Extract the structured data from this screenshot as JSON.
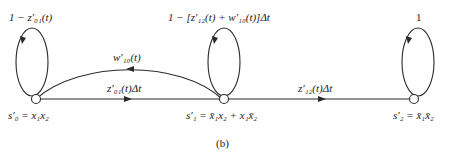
{
  "diagram": {
    "type": "state-transition-diagram",
    "states": [
      {
        "id": "s0",
        "label": "s′₀ = x₁x₂",
        "self_loop_label": "1 − z′₀₁(t)"
      },
      {
        "id": "s1",
        "label": "s′₁ = x̄₁x₂ + x₁x̄₂",
        "self_loop_label": "1 − [z′₁₂(t) + w′₁₀(t)]Δt"
      },
      {
        "id": "s2",
        "label": "s′₂ = x̄₁x̄₂",
        "self_loop_label": "1"
      }
    ],
    "transitions": [
      {
        "from": "s0",
        "to": "s1",
        "label": "z′₀₁(t)Δt"
      },
      {
        "from": "s1",
        "to": "s0",
        "label": "w′₁₀(t)"
      },
      {
        "from": "s1",
        "to": "s2",
        "label": "z′₁₂(t)Δt"
      }
    ],
    "caption": "(b)"
  }
}
